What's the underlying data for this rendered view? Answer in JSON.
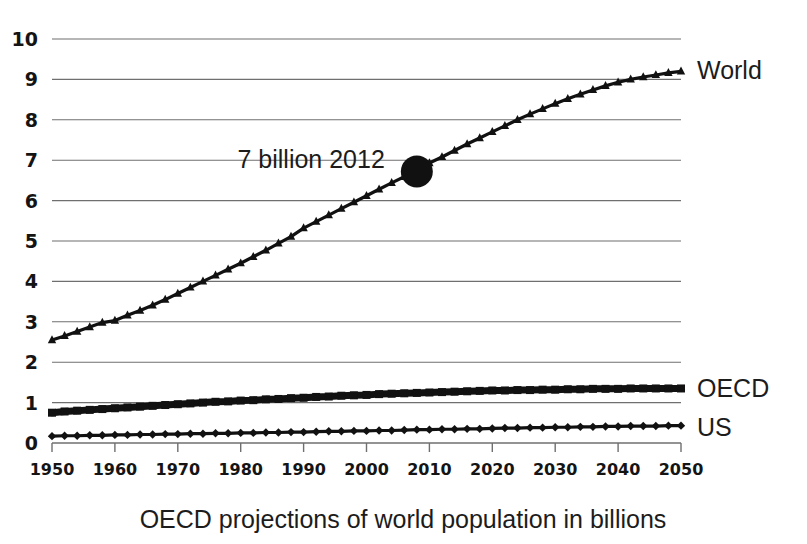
{
  "chart_data": {
    "type": "line",
    "title": "",
    "caption": "OECD projections of world population in billions",
    "xlabel": "",
    "ylabel": "",
    "xlim": [
      1950,
      2050
    ],
    "ylim": [
      0,
      10
    ],
    "grid": true,
    "legend_position": "right-of-plot-inline",
    "x_tick_labels": [
      "1950",
      "1960",
      "1970",
      "1980",
      "1990",
      "2000",
      "2010",
      "2020",
      "2030",
      "2040",
      "2050"
    ],
    "y_tick_labels": [
      "0",
      "1",
      "2",
      "3",
      "4",
      "5",
      "6",
      "7",
      "8",
      "9",
      "10"
    ],
    "x": [
      1950,
      1952,
      1954,
      1956,
      1958,
      1960,
      1962,
      1964,
      1966,
      1968,
      1970,
      1972,
      1974,
      1976,
      1978,
      1980,
      1982,
      1984,
      1986,
      1988,
      1990,
      1992,
      1994,
      1996,
      1998,
      2000,
      2002,
      2004,
      2006,
      2008,
      2010,
      2012,
      2014,
      2016,
      2018,
      2020,
      2022,
      2024,
      2026,
      2028,
      2030,
      2032,
      2034,
      2036,
      2038,
      2040,
      2042,
      2044,
      2046,
      2048,
      2050
    ],
    "series": [
      {
        "name": "World",
        "marker": "triangle",
        "color": "#111111",
        "values": [
          2.55,
          2.65,
          2.76,
          2.87,
          2.98,
          3.03,
          3.16,
          3.28,
          3.41,
          3.55,
          3.7,
          3.85,
          4.0,
          4.15,
          4.3,
          4.45,
          4.61,
          4.77,
          4.94,
          5.11,
          5.32,
          5.48,
          5.64,
          5.8,
          5.96,
          6.12,
          6.28,
          6.44,
          6.59,
          6.73,
          6.93,
          7.08,
          7.24,
          7.4,
          7.55,
          7.7,
          7.85,
          8.0,
          8.14,
          8.27,
          8.4,
          8.52,
          8.63,
          8.74,
          8.84,
          8.93,
          9.0,
          9.06,
          9.11,
          9.16,
          9.2
        ]
      },
      {
        "name": "OECD",
        "marker": "square",
        "color": "#111111",
        "values": [
          0.75,
          0.78,
          0.8,
          0.82,
          0.84,
          0.86,
          0.88,
          0.9,
          0.92,
          0.94,
          0.96,
          0.98,
          1.0,
          1.02,
          1.03,
          1.05,
          1.06,
          1.08,
          1.09,
          1.11,
          1.12,
          1.14,
          1.15,
          1.17,
          1.18,
          1.19,
          1.21,
          1.22,
          1.23,
          1.24,
          1.25,
          1.26,
          1.27,
          1.28,
          1.29,
          1.3,
          1.3,
          1.31,
          1.31,
          1.32,
          1.32,
          1.33,
          1.33,
          1.34,
          1.34,
          1.34,
          1.35,
          1.35,
          1.35,
          1.35,
          1.35
        ]
      },
      {
        "name": "US",
        "marker": "diamond",
        "color": "#111111",
        "values": [
          0.17,
          0.18,
          0.18,
          0.19,
          0.19,
          0.2,
          0.2,
          0.21,
          0.21,
          0.22,
          0.22,
          0.23,
          0.23,
          0.24,
          0.24,
          0.25,
          0.25,
          0.26,
          0.26,
          0.27,
          0.27,
          0.28,
          0.29,
          0.29,
          0.3,
          0.3,
          0.31,
          0.31,
          0.32,
          0.33,
          0.33,
          0.34,
          0.34,
          0.35,
          0.35,
          0.36,
          0.37,
          0.37,
          0.38,
          0.38,
          0.39,
          0.39,
          0.4,
          0.4,
          0.41,
          0.41,
          0.42,
          0.42,
          0.42,
          0.43,
          0.43
        ]
      }
    ],
    "annotations": [
      {
        "text": "7 billion 2012",
        "marker": "filled-circle",
        "x": 2008,
        "y": 6.72
      }
    ]
  },
  "labels": {
    "world": "World",
    "oecd": "OECD",
    "us": "US"
  }
}
